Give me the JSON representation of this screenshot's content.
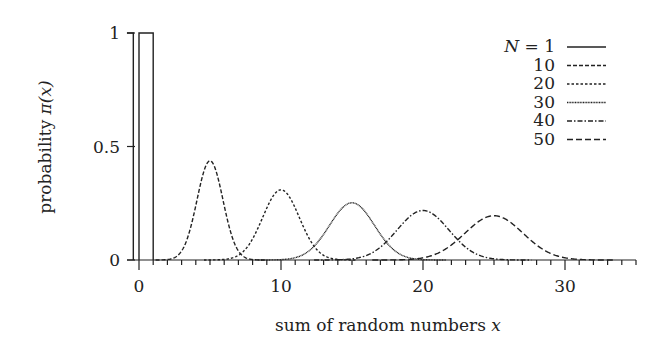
{
  "chart_data": {
    "type": "line",
    "title": "",
    "xlabel": "sum of random numbers x",
    "ylabel": "probability π(x)",
    "xlim": [
      -0.85,
      35
    ],
    "ylim": [
      0,
      1
    ],
    "xticks": [
      0,
      10,
      20,
      30
    ],
    "xtick_labels": [
      "0",
      "10",
      "20",
      "30"
    ],
    "x_minor_tick_step": 1,
    "yticks": [
      0,
      0.5,
      1
    ],
    "ytick_labels": [
      "0",
      "0.5",
      "1"
    ],
    "grid": false,
    "legend_position": "upper right",
    "legend_prefix": "N =",
    "series": [
      {
        "name": "1",
        "N": 1,
        "style": "solid",
        "dash": "",
        "kind": "uniform",
        "support": [
          0,
          1
        ],
        "peak": 1.0
      },
      {
        "name": "10",
        "N": 10,
        "style": "dashed",
        "dash": "4 2",
        "kind": "gaussian",
        "mean": 5,
        "sd": 0.913,
        "peak": 0.437
      },
      {
        "name": "20",
        "N": 20,
        "style": "dotted",
        "dash": "2.5 2",
        "kind": "gaussian",
        "mean": 10,
        "sd": 1.291,
        "peak": 0.309
      },
      {
        "name": "30",
        "N": 30,
        "style": "fine-dotted",
        "dash": "1 0.6",
        "kind": "gaussian",
        "mean": 15,
        "sd": 1.581,
        "peak": 0.252
      },
      {
        "name": "40",
        "N": 40,
        "style": "dash-dot",
        "dash": "5 2 1.5 2",
        "kind": "gaussian",
        "mean": 20,
        "sd": 1.826,
        "peak": 0.218
      },
      {
        "name": "50",
        "N": 50,
        "style": "long-dash",
        "dash": "6 3",
        "kind": "gaussian",
        "mean": 25,
        "sd": 2.041,
        "peak": 0.195
      }
    ]
  },
  "legend": {
    "prefix": "N = ",
    "labels": [
      "1",
      "10",
      "20",
      "30",
      "40",
      "50"
    ]
  },
  "axes": {
    "xlabel_text": "sum of random numbers ",
    "xlabel_var": "x",
    "ylabel_text": "probability ",
    "ylabel_var": "π(x)"
  }
}
